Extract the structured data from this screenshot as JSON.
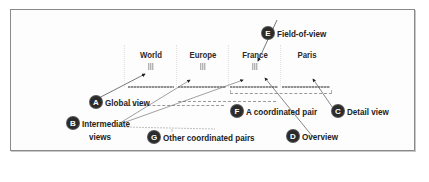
{
  "diagram": {
    "views": [
      {
        "label": "World"
      },
      {
        "label": "Europe"
      },
      {
        "label": "France"
      },
      {
        "label": "Paris"
      }
    ],
    "callouts": {
      "a": {
        "badge": "A",
        "text": "Global view"
      },
      "b": {
        "badge": "B",
        "text": "Intermediate",
        "text2": "views"
      },
      "c": {
        "badge": "C",
        "text": "Detail view"
      },
      "d": {
        "badge": "D",
        "text": "Overview"
      },
      "e": {
        "badge": "E",
        "text": "Field-of-view"
      },
      "f": {
        "badge": "F",
        "text": "A coordinated pair"
      },
      "g": {
        "badge": "G",
        "text": "Other coordinated pairs"
      }
    },
    "colors": {
      "frame": "#8a8a8a",
      "badge": "#2b2b2b",
      "text": "#222222",
      "leader": "#555555"
    }
  }
}
